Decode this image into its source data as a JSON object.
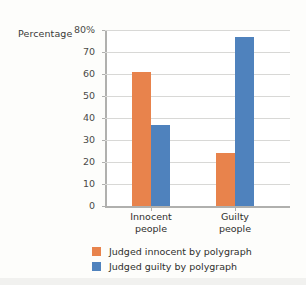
{
  "chart_data": {
    "type": "bar",
    "title": "",
    "xlabel": "",
    "ylabel": "Percentage",
    "categories": [
      "Innocent people",
      "Guilty people"
    ],
    "category_lines": [
      [
        "Innocent",
        "people"
      ],
      [
        "Guilty",
        "people"
      ]
    ],
    "series": [
      {
        "name": "Judged innocent by polygraph",
        "color": "#e8834c",
        "values": [
          61,
          24
        ]
      },
      {
        "name": "Judged guilty by polygraph",
        "color": "#4f82bd",
        "values": [
          37,
          77
        ]
      }
    ],
    "ylim": [
      0,
      80
    ],
    "ytick_values": [
      0,
      10,
      20,
      30,
      40,
      50,
      60,
      70,
      80
    ],
    "ytick_labels": [
      "0",
      "10",
      "20",
      "30",
      "40",
      "50",
      "60",
      "70",
      "80%"
    ],
    "grid": true,
    "legend_position": "bottom"
  },
  "axis": {
    "y_title": "Percentage"
  },
  "legend": {
    "items": [
      {
        "label": "Judged innocent by polygraph"
      },
      {
        "label": "Judged guilty by polygraph"
      }
    ]
  },
  "colors": {
    "series_a": "#e8834c",
    "series_b": "#4f82bd",
    "gridline": "#d8d8d6",
    "axis": "#b0b0ae",
    "background": "#fdfdfb",
    "plot_background": "#ffffff",
    "text": "#2f2f2d"
  }
}
